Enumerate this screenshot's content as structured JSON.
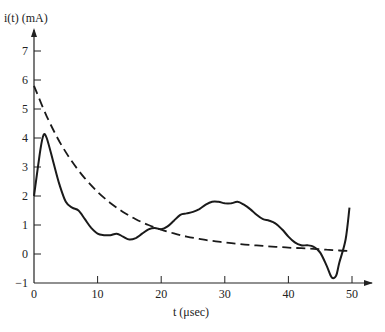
{
  "chart_data": {
    "type": "line",
    "title": "",
    "xlabel": "t (μsec)",
    "ylabel": "i(t) (mA)",
    "xlim": [
      0,
      50
    ],
    "ylim": [
      -1,
      7
    ],
    "x_ticks": [
      0,
      10,
      20,
      30,
      40,
      50
    ],
    "y_ticks": [
      -1,
      0,
      1,
      2,
      3,
      4,
      5,
      6,
      7
    ],
    "grid": false,
    "legend": null,
    "series": [
      {
        "name": "measured current (solid)",
        "style": "solid",
        "x": [
          0,
          1,
          1.5,
          2,
          3,
          4,
          5,
          6,
          7,
          8,
          9,
          10,
          11,
          12,
          13,
          14,
          15,
          16,
          17,
          18,
          19,
          20,
          21,
          22,
          23,
          24,
          25,
          26,
          27,
          28,
          29,
          30,
          31,
          32,
          33,
          34,
          35,
          36,
          37,
          38,
          39,
          40,
          41,
          42,
          43,
          44,
          45,
          46,
          46.8,
          47.5,
          48,
          49,
          49.6
        ],
        "values": [
          2.0,
          3.6,
          4.1,
          4.0,
          3.2,
          2.4,
          1.8,
          1.6,
          1.5,
          1.2,
          0.9,
          0.7,
          0.65,
          0.65,
          0.7,
          0.6,
          0.5,
          0.55,
          0.7,
          0.85,
          0.9,
          0.85,
          0.95,
          1.15,
          1.35,
          1.4,
          1.45,
          1.55,
          1.7,
          1.8,
          1.8,
          1.75,
          1.75,
          1.8,
          1.7,
          1.55,
          1.35,
          1.2,
          1.15,
          1.05,
          0.85,
          0.6,
          0.4,
          0.3,
          0.3,
          0.25,
          0.05,
          -0.4,
          -0.8,
          -0.75,
          -0.3,
          0.5,
          1.6
        ]
      },
      {
        "name": "exponential decay (dashed)",
        "style": "dashed",
        "x": [
          0,
          2,
          4,
          6,
          8,
          10,
          12,
          14,
          16,
          18,
          20,
          22,
          24,
          26,
          28,
          30,
          32,
          34,
          36,
          38,
          40,
          42,
          44,
          46,
          48,
          50
        ],
        "values": [
          5.8,
          4.75,
          3.88,
          3.18,
          2.61,
          2.14,
          1.76,
          1.45,
          1.2,
          1.0,
          0.84,
          0.71,
          0.6,
          0.52,
          0.45,
          0.4,
          0.35,
          0.31,
          0.28,
          0.25,
          0.22,
          0.2,
          0.18,
          0.15,
          0.12,
          0.1
        ]
      }
    ]
  },
  "labels": {
    "y_axis_title": "i(t) (mA)",
    "x_axis_title": "t (μsec)"
  }
}
